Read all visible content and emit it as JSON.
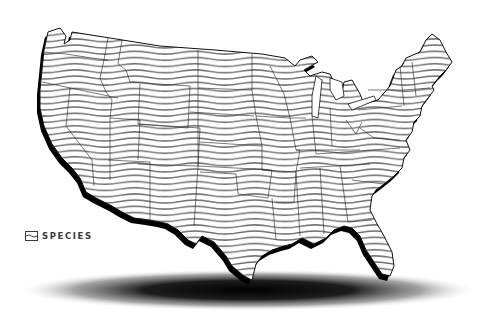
{
  "map": {
    "title": "Contiguous United States",
    "style": "wavy horizontal stripes with state borders and extruded drop shadow",
    "fill_pattern": "wavy-stripes",
    "stripe_color": "#6f6f6f",
    "border_color": "#222222",
    "shadow_color": "#000000",
    "background": "#ffffff"
  },
  "logo": {
    "icon": "species-logo-icon",
    "label": "SPECIES",
    "color": "#3a3a3a"
  }
}
